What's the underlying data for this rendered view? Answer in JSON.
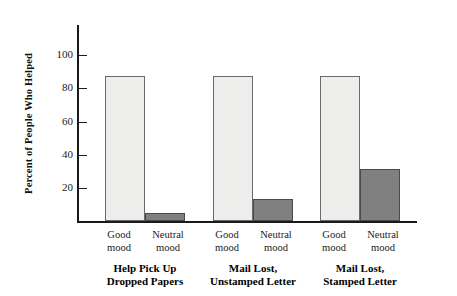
{
  "chart_data": {
    "type": "bar",
    "title": "",
    "xlabel": "",
    "ylabel": "Percent of People Who Helped",
    "ylim": [
      0,
      110
    ],
    "yticks": [
      20,
      40,
      60,
      80,
      100
    ],
    "grid": false,
    "legend": "none",
    "categories": [
      "Help Pick Up\nDropped Papers",
      "Mail Lost,\nUnstamped Letter",
      "Mail Lost,\nStamped Letter"
    ],
    "subcategories": [
      "Good\nmood",
      "Neutral\nmood"
    ],
    "series": [
      {
        "name": "Good mood",
        "values": [
          87,
          87,
          87
        ],
        "color": "#ededec"
      },
      {
        "name": "Neutral mood",
        "values": [
          5,
          13,
          31
        ],
        "color": "#808080"
      }
    ],
    "bars": [
      {
        "group": "Help Pick Up Dropped Papers",
        "sub": "Good mood",
        "value": 87,
        "style": "light"
      },
      {
        "group": "Help Pick Up Dropped Papers",
        "sub": "Neutral mood",
        "value": 5,
        "style": "dark"
      },
      {
        "group": "Mail Lost, Unstamped Letter",
        "sub": "Good mood",
        "value": 87,
        "style": "light"
      },
      {
        "group": "Mail Lost, Unstamped Letter",
        "sub": "Neutral mood",
        "value": 13,
        "style": "dark"
      },
      {
        "group": "Mail Lost, Stamped Letter",
        "sub": "Good mood",
        "value": 87,
        "style": "light"
      },
      {
        "group": "Mail Lost, Stamped Letter",
        "sub": "Neutral mood",
        "value": 31,
        "style": "dark"
      }
    ]
  },
  "axis": {
    "y_title": "Percent of People Who Helped",
    "ticks": [
      {
        "label": "100",
        "value": 100
      },
      {
        "label": "80",
        "value": 80
      },
      {
        "label": "60",
        "value": 60
      },
      {
        "label": "40",
        "value": 40
      },
      {
        "label": "20",
        "value": 20
      }
    ]
  },
  "groups": [
    {
      "label": "Help Pick Up\nDropped Papers",
      "good_label": "Good\nmood",
      "neutral_label": "Neutral\nmood"
    },
    {
      "label": "Mail Lost,\nUnstamped Letter",
      "good_label": "Good\nmood",
      "neutral_label": "Neutral\nmood"
    },
    {
      "label": "Mail Lost,\nStamped Letter",
      "good_label": "Good\nmood",
      "neutral_label": "Neutral\nmood"
    }
  ],
  "colors": {
    "good_mood_bar": "#ededec",
    "neutral_mood_bar": "#808080",
    "axis": "#1a1a1a",
    "background": "#ffffff"
  }
}
